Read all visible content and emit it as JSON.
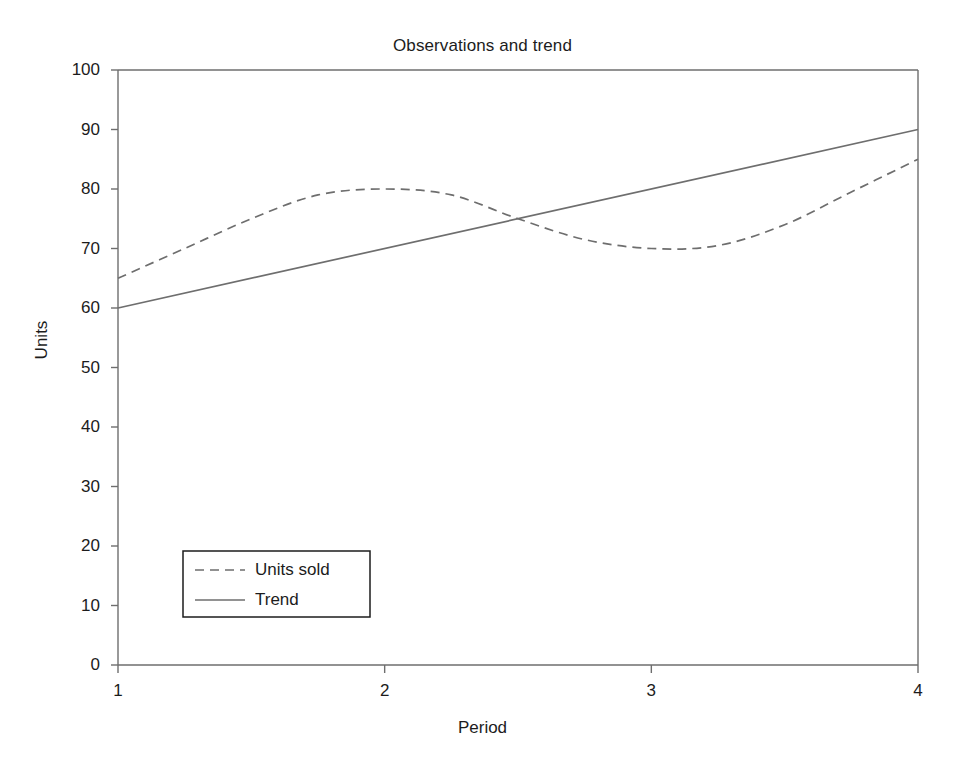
{
  "chart_data": {
    "type": "line",
    "title": "Observations and trend",
    "xlabel": "Period",
    "ylabel": "Units",
    "xlim": [
      1,
      4
    ],
    "ylim": [
      0,
      100
    ],
    "grid": false,
    "legend_position": "lower left",
    "x_ticks": [
      "1",
      "2",
      "3",
      "4"
    ],
    "y_ticks": [
      "0",
      "10",
      "20",
      "30",
      "40",
      "50",
      "60",
      "70",
      "80",
      "90",
      "100"
    ],
    "series": [
      {
        "name": "Units sold",
        "style": "dashed",
        "color": "#6e6e6e",
        "x": [
          1,
          1.25,
          1.5,
          1.75,
          2,
          2.25,
          2.5,
          2.75,
          3,
          3.25,
          3.5,
          3.75,
          4
        ],
        "values": [
          65,
          70,
          75,
          79,
          80,
          79,
          75,
          71.5,
          70,
          70.5,
          74,
          79.5,
          85
        ]
      },
      {
        "name": "Trend",
        "style": "solid",
        "color": "#6e6e6e",
        "x": [
          1,
          4
        ],
        "values": [
          60,
          90
        ]
      }
    ]
  },
  "legend": {
    "items": [
      {
        "label": "Units sold"
      },
      {
        "label": "Trend"
      }
    ]
  },
  "colors": {
    "axis": "#6e6e6e",
    "text": "#1c1c1c",
    "series": "#6e6e6e",
    "background": "#ffffff"
  }
}
